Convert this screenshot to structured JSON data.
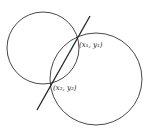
{
  "diagram": {
    "type": "two intersecting circles with a secant line through intersection points",
    "stroke_color": "#333333",
    "circles": [
      {
        "name": "small-circle",
        "cx": 43,
        "cy": 48,
        "r": 36
      },
      {
        "name": "large-circle",
        "cx": 96,
        "cy": 79,
        "r": 46
      }
    ],
    "line": {
      "x1": 37,
      "y1": 110,
      "x2": 90,
      "y2": 16
    },
    "points": [
      {
        "label": "(x₁, y₁)",
        "x": 78,
        "y": 40,
        "label_x": 79,
        "label_y": 47
      },
      {
        "label": "(x₂, y₂)",
        "x": 52,
        "y": 82,
        "label_x": 53,
        "label_y": 90
      }
    ]
  }
}
